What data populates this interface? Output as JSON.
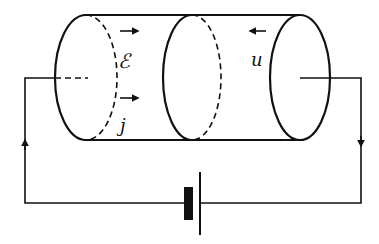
{
  "diagram": {
    "kind": "circuit with conducting cylinder",
    "colors": {
      "stroke": "#111111",
      "background": "#ffffff"
    },
    "labels": {
      "field": "ℰ",
      "current_density": "j",
      "drift_velocity": "u"
    },
    "arrows": {
      "field_direction": "right",
      "current_density_direction": "right",
      "drift_velocity_direction": "left",
      "left_wire_current": "up",
      "right_wire_current": "down"
    },
    "components": [
      "cylinder-conductor",
      "cross-section-left",
      "cross-section-middle",
      "cross-section-right",
      "battery",
      "wire-left",
      "wire-right"
    ]
  }
}
